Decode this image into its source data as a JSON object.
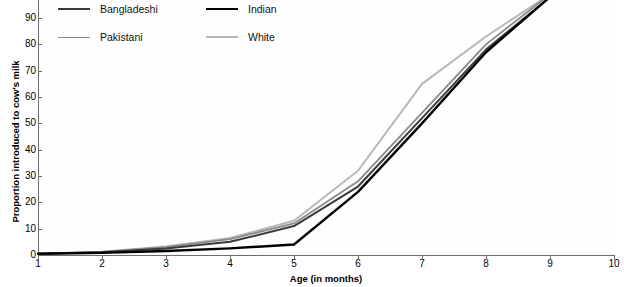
{
  "chart_data": {
    "type": "line",
    "title": "",
    "xlabel": "Age (in months)",
    "ylabel": "Proportion introduced to cow's milk",
    "xlim": [
      1,
      10
    ],
    "ylim": [
      0,
      100
    ],
    "grid": false,
    "legend_position": "top-left",
    "x": [
      1,
      2,
      3,
      4,
      5,
      6,
      7,
      8,
      9,
      10
    ],
    "xticks": [
      "1",
      "2",
      "3",
      "4",
      "5",
      "6",
      "7",
      "8",
      "9",
      "10"
    ],
    "yticks": [
      "0",
      "10",
      "20",
      "30",
      "40",
      "50",
      "60",
      "70",
      "80",
      "90"
    ],
    "series": [
      {
        "name": "Bangladeshi",
        "color": "#3a3a3a",
        "width": 2.0,
        "values": [
          0.5,
          1.0,
          2.5,
          5.0,
          11.0,
          26.0,
          52.0,
          78.0,
          98.0,
          100.0
        ]
      },
      {
        "name": "Indian",
        "color": "#000000",
        "width": 2.4,
        "values": [
          0.5,
          0.8,
          1.5,
          2.5,
          4.0,
          24.0,
          50.0,
          77.0,
          98.0,
          100.0
        ]
      },
      {
        "name": "Pakistani",
        "color": "#8a8a8a",
        "width": 1.8,
        "values": [
          0.5,
          1.2,
          3.0,
          6.0,
          12.0,
          28.0,
          54.0,
          80.0,
          99.0,
          100.0
        ]
      },
      {
        "name": "White",
        "color": "#b8b8b8",
        "width": 2.0,
        "values": [
          0.5,
          1.2,
          3.2,
          6.5,
          13.0,
          32.0,
          65.0,
          83.0,
          99.0,
          100.0
        ]
      }
    ]
  },
  "legend": {
    "items": [
      {
        "label": "Bangladeshi",
        "color": "#3a3a3a",
        "width": "2.2px"
      },
      {
        "label": "Indian",
        "color": "#000000",
        "width": "2.8px"
      },
      {
        "label": "Pakistani",
        "color": "#8a8a8a",
        "width": "1.8px"
      },
      {
        "label": "White",
        "color": "#b8b8b8",
        "width": "2.0px"
      }
    ]
  },
  "axes": {
    "y_title": "Proportion introduced to cow's milk",
    "x_title": "Age (in months)"
  }
}
